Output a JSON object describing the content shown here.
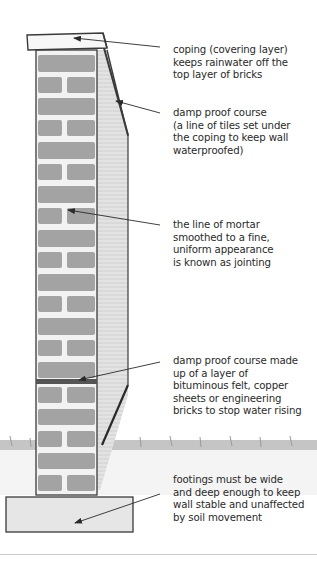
{
  "diagram": {
    "colors": {
      "brick": "#9e9e9e",
      "mortar": "#f2f2f2",
      "outline": "#3a3a3a",
      "side_face": "#d9d9d9",
      "ground_grass": "#a8a8a8",
      "footing": "#e4e4e4",
      "text": "#2a2a2a"
    },
    "annotations": [
      {
        "id": "coping",
        "lines": [
          "coping (covering layer)",
          "keeps rainwater off the",
          "top layer of bricks"
        ]
      },
      {
        "id": "damp-proof-course-top",
        "lines": [
          "damp proof course",
          "(a line of tiles set under",
          "the coping to keep wall",
          "waterproofed)"
        ]
      },
      {
        "id": "jointing",
        "lines": [
          "the line of mortar",
          "smoothed to a fine,",
          "uniform appearance",
          "is known as jointing"
        ]
      },
      {
        "id": "damp-proof-course-bottom",
        "lines": [
          "damp proof course made",
          "up of a layer of",
          "bituminous felt, copper",
          "sheets or engineering",
          "bricks to stop water rising"
        ]
      },
      {
        "id": "footings",
        "lines": [
          "footings must be wide",
          "and deep enough to keep",
          "wall stable and unaffected",
          "by soil movement"
        ]
      }
    ]
  }
}
